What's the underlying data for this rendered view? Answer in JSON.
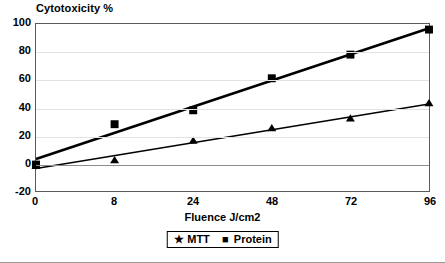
{
  "chart_data": {
    "type": "line",
    "title": "Cytotoxicity %",
    "xlabel": "Fluence J/cm2",
    "ylabel": "",
    "categories": [
      "0",
      "8",
      "24",
      "48",
      "72",
      "96"
    ],
    "yticks": [
      "-20",
      "0",
      "20",
      "40",
      "60",
      "80",
      "100"
    ],
    "ylim": [
      -20,
      100
    ],
    "grid": true,
    "legend_position": "bottom-center",
    "series": [
      {
        "name": "MTT",
        "marker": "triangle",
        "values": [
          -2,
          2,
          16,
          25,
          32,
          43
        ]
      },
      {
        "name": "Protein",
        "marker": "square",
        "values": [
          -1,
          28,
          38,
          61,
          78,
          96
        ]
      }
    ]
  },
  "legend": {
    "items": [
      {
        "label": "MTT",
        "glyph": "★"
      },
      {
        "label": "Protein",
        "glyph": "■"
      }
    ]
  },
  "colors": {
    "series_line": "#000000",
    "axis": "#5a5a5a",
    "grid": "#e2e2e2",
    "zero_line": "#8d8d8d",
    "background": "#ffffff"
  }
}
